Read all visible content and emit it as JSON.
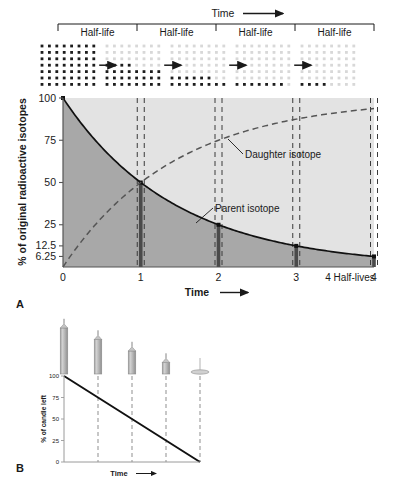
{
  "figure": {
    "panelA_letter": "A",
    "panelB_letter": "B"
  },
  "top_strip": {
    "time_label": "Time",
    "arrow": "right-arrow",
    "segments": [
      {
        "label": "Half-life"
      },
      {
        "label": "Half-life"
      },
      {
        "label": "Half-life"
      },
      {
        "label": "Half-life"
      }
    ],
    "grids": [
      {
        "index": 0,
        "percent_parent": 100,
        "cols": 8,
        "rows": 7,
        "dark_dots": 56
      },
      {
        "index": 1,
        "percent_parent": 50,
        "cols": 8,
        "rows": 7,
        "dark_dots": 28
      },
      {
        "index": 2,
        "percent_parent": 25,
        "cols": 8,
        "rows": 7,
        "dark_dots": 14
      },
      {
        "index": 3,
        "percent_parent": 12.5,
        "cols": 8,
        "rows": 7,
        "dark_dots": 7
      },
      {
        "index": 4,
        "percent_parent": 6.25,
        "cols": 8,
        "rows": 7,
        "dark_dots": 3
      }
    ]
  },
  "chart_data": [
    {
      "id": "panelA",
      "type": "line",
      "title": "",
      "xlabel": "Time",
      "ylabel": "% of original radioactive isotopes",
      "x_axis_end_label": "4 Half-lives",
      "xlim": [
        0,
        4
      ],
      "ylim": [
        0,
        100
      ],
      "x_ticks": [
        0,
        1,
        2,
        3,
        4
      ],
      "x_tick_labels": [
        "0",
        "1",
        "2",
        "3",
        "4"
      ],
      "y_ticks": [
        6.25,
        12.5,
        25,
        50,
        75,
        100
      ],
      "y_tick_labels": [
        "6.25",
        "12.5",
        "25",
        "50",
        "75",
        "100"
      ],
      "grid": false,
      "legend_position": "inline-annotation",
      "annotations": [
        {
          "text": "Daughter isotope",
          "series": "daughter"
        },
        {
          "text": "Parent isotope",
          "series": "parent"
        }
      ],
      "series": [
        {
          "name": "Parent isotope",
          "style": "solid",
          "x": [
            0,
            1,
            2,
            3,
            4
          ],
          "values": [
            100,
            50,
            25,
            12.5,
            6.25
          ]
        },
        {
          "name": "Daughter isotope",
          "style": "dashed",
          "x": [
            0,
            1,
            2,
            3,
            4
          ],
          "values": [
            0,
            50,
            75,
            87.5,
            93.75
          ]
        }
      ],
      "markers": [
        {
          "x": 1,
          "y": 50
        },
        {
          "x": 2,
          "y": 25
        },
        {
          "x": 3,
          "y": 12.5
        },
        {
          "x": 4,
          "y": 6.25
        }
      ]
    },
    {
      "id": "panelB",
      "type": "line",
      "title": "",
      "xlabel": "Time",
      "ylabel": "% of candle left",
      "xlim": [
        0,
        4
      ],
      "ylim": [
        0,
        100
      ],
      "x_ticks": [
        0,
        1,
        2,
        3,
        4
      ],
      "x_tick_labels": [
        "",
        "",
        "",
        "",
        ""
      ],
      "y_ticks": [
        0,
        25,
        50,
        75,
        100
      ],
      "y_tick_labels": [
        "0",
        "25",
        "50",
        "75",
        "100"
      ],
      "grid": false,
      "series": [
        {
          "name": "Candle left",
          "style": "solid",
          "x": [
            0,
            1,
            2,
            3,
            4
          ],
          "values": [
            100,
            75,
            50,
            25,
            0
          ]
        }
      ],
      "candles": [
        {
          "index": 0,
          "percent_left": 100
        },
        {
          "index": 1,
          "percent_left": 75
        },
        {
          "index": 2,
          "percent_left": 50
        },
        {
          "index": 3,
          "percent_left": 25
        },
        {
          "index": 4,
          "percent_left": 0
        }
      ]
    }
  ],
  "colors": {
    "parent_area": "#a8a8a8",
    "daughter_area": "#e3e3e3",
    "curve": "#111111",
    "dashed": "#555555",
    "marker_bar": "#4a4a4a",
    "candle_body": "#b5b5b5",
    "candle_edge": "#8c8c8c",
    "axis": "#555555"
  }
}
